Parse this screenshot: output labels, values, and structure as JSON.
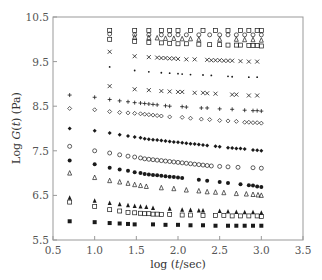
{
  "chart_data": {
    "type": "scatter",
    "title": "",
    "xlabel": "log (t/sec)",
    "ylabel": "Log G(t) (Pa)",
    "xlim": [
      0.5,
      3.5
    ],
    "ylim": [
      5.5,
      10.5
    ],
    "xticks": [
      "0.5",
      "1.0",
      "1.5",
      "2.0",
      "2.5",
      "3.0",
      "3.5"
    ],
    "yticks": [
      "5.5",
      "6.5",
      "7.5",
      "8.5",
      "9.5",
      "10.5"
    ],
    "grid": false,
    "legend": "none",
    "series": [
      {
        "name": "filled-square",
        "marker": "square-filled",
        "x": [
          0.7,
          1.0,
          1.18,
          1.3,
          1.4,
          1.48,
          1.7,
          1.85,
          2.0,
          2.15,
          2.3,
          2.45,
          2.6,
          2.7,
          2.8,
          2.9,
          3.0
        ],
        "y": [
          5.92,
          5.9,
          5.88,
          5.87,
          5.86,
          5.85,
          5.85,
          5.84,
          5.84,
          5.83,
          5.83,
          5.82,
          5.82,
          5.82,
          5.82,
          5.82,
          5.82
        ]
      },
      {
        "name": "open-square-low",
        "marker": "square-open",
        "x": [
          0.7,
          1.0,
          1.18,
          1.3,
          1.4,
          1.48,
          1.55,
          1.6,
          1.65,
          1.7,
          1.75,
          1.8,
          1.9,
          2.05,
          2.15,
          2.3,
          2.45,
          2.55,
          2.65,
          2.75,
          2.85,
          2.95,
          3.0
        ],
        "y": [
          6.35,
          6.25,
          6.18,
          6.15,
          6.12,
          6.11,
          6.1,
          6.09,
          6.09,
          6.08,
          6.08,
          6.07,
          6.07,
          6.06,
          6.06,
          6.05,
          6.05,
          6.05,
          6.04,
          6.04,
          6.04,
          6.04,
          6.03
        ]
      },
      {
        "name": "filled-triangle",
        "marker": "triangle-filled",
        "x": [
          0.7,
          1.0,
          1.18,
          1.3,
          1.4,
          1.48,
          1.55,
          1.62,
          1.7,
          1.9,
          2.05,
          2.15,
          2.25,
          2.3,
          2.5,
          2.6,
          2.7,
          2.8,
          2.9,
          3.0
        ],
        "y": [
          6.45,
          6.38,
          6.33,
          6.3,
          6.28,
          6.26,
          6.25,
          6.24,
          6.22,
          6.2,
          6.18,
          6.17,
          6.16,
          6.16,
          6.15,
          6.14,
          6.13,
          6.12,
          6.12,
          6.11
        ]
      },
      {
        "name": "open-triangle-low",
        "marker": "triangle-open",
        "x": [
          0.7,
          1.0,
          1.18,
          1.3,
          1.4,
          1.48,
          1.55,
          1.62,
          1.8,
          1.95,
          2.1,
          2.25,
          2.35,
          2.45,
          2.55,
          2.7,
          2.82,
          2.9,
          2.96,
          3.0
        ],
        "y": [
          7.0,
          6.9,
          6.83,
          6.8,
          6.77,
          6.74,
          6.72,
          6.7,
          6.67,
          6.65,
          6.62,
          6.6,
          6.58,
          6.57,
          6.56,
          6.54,
          6.53,
          6.52,
          6.51,
          6.5
        ]
      },
      {
        "name": "filled-circle-low",
        "marker": "circle-filled",
        "x": [
          0.7,
          1.0,
          1.18,
          1.3,
          1.4,
          1.48,
          1.55,
          1.6,
          1.65,
          1.7,
          1.75,
          1.8,
          1.85,
          1.9,
          1.95,
          2.0,
          2.05,
          2.25,
          2.35,
          2.5,
          2.6,
          2.75,
          2.85,
          2.9,
          2.95,
          3.0
        ],
        "y": [
          7.28,
          7.2,
          7.12,
          7.08,
          7.05,
          7.02,
          7.0,
          6.98,
          6.97,
          6.96,
          6.95,
          6.94,
          6.93,
          6.92,
          6.91,
          6.9,
          6.89,
          6.85,
          6.83,
          6.8,
          6.78,
          6.75,
          6.73,
          6.72,
          6.7,
          6.69
        ]
      },
      {
        "name": "open-circle-low",
        "marker": "circle-open",
        "x": [
          0.7,
          1.0,
          1.18,
          1.3,
          1.4,
          1.48,
          1.55,
          1.6,
          1.65,
          1.7,
          1.75,
          1.8,
          1.85,
          1.9,
          1.95,
          2.0,
          2.05,
          2.1,
          2.15,
          2.2,
          2.25,
          2.3,
          2.35,
          2.4,
          2.5,
          2.6,
          2.72,
          2.9,
          3.0
        ],
        "y": [
          7.6,
          7.5,
          7.45,
          7.41,
          7.38,
          7.36,
          7.34,
          7.32,
          7.31,
          7.3,
          7.29,
          7.28,
          7.27,
          7.26,
          7.25,
          7.24,
          7.23,
          7.22,
          7.21,
          7.2,
          7.19,
          7.18,
          7.17,
          7.16,
          7.15,
          7.14,
          7.13,
          7.12,
          7.11
        ]
      },
      {
        "name": "filled-diamond",
        "marker": "diamond-filled",
        "x": [
          0.7,
          1.0,
          1.18,
          1.3,
          1.4,
          1.48,
          1.55,
          1.6,
          1.65,
          1.7,
          1.75,
          1.8,
          1.85,
          1.9,
          1.95,
          2.0,
          2.05,
          2.1,
          2.15,
          2.2,
          2.25,
          2.3,
          2.35,
          2.45,
          2.5,
          2.6,
          2.65,
          2.7,
          2.75,
          2.8,
          2.9,
          2.95,
          3.0
        ],
        "y": [
          8.0,
          7.95,
          7.9,
          7.86,
          7.83,
          7.81,
          7.79,
          7.77,
          7.76,
          7.75,
          7.74,
          7.73,
          7.72,
          7.71,
          7.7,
          7.69,
          7.68,
          7.67,
          7.66,
          7.65,
          7.64,
          7.63,
          7.62,
          7.6,
          7.59,
          7.57,
          7.56,
          7.55,
          7.55,
          7.54,
          7.52,
          7.51,
          7.5
        ]
      },
      {
        "name": "open-diamond",
        "marker": "diamond-open",
        "x": [
          0.7,
          1.0,
          1.18,
          1.3,
          1.4,
          1.48,
          1.55,
          1.6,
          1.65,
          1.7,
          1.75,
          1.8,
          1.9,
          2.05,
          2.15,
          2.28,
          2.38,
          2.5,
          2.6,
          2.7,
          2.8,
          2.85,
          2.9,
          2.95,
          3.0
        ],
        "y": [
          8.45,
          8.42,
          8.38,
          8.36,
          8.35,
          8.34,
          8.33,
          8.32,
          8.31,
          8.3,
          8.29,
          8.28,
          8.26,
          8.25,
          8.23,
          8.21,
          8.2,
          8.18,
          8.17,
          8.16,
          8.14,
          8.14,
          8.13,
          8.13,
          8.12
        ]
      },
      {
        "name": "plus",
        "marker": "plus",
        "x": [
          0.7,
          1.0,
          1.18,
          1.3,
          1.4,
          1.48,
          1.55,
          1.6,
          1.65,
          1.7,
          1.75,
          1.85,
          1.9,
          2.05,
          2.1,
          2.28,
          2.35,
          2.5,
          2.65,
          2.8,
          2.9,
          2.95,
          3.0
        ],
        "y": [
          8.75,
          8.7,
          8.65,
          8.62,
          8.6,
          8.58,
          8.57,
          8.56,
          8.55,
          8.54,
          8.53,
          8.51,
          8.5,
          8.49,
          8.48,
          8.46,
          8.46,
          8.44,
          8.43,
          8.41,
          8.4,
          8.4,
          8.39
        ]
      },
      {
        "name": "cross-low",
        "marker": "x",
        "x": [
          1.18,
          1.48,
          1.65,
          1.8,
          1.9,
          2.0,
          2.05,
          2.2,
          2.3,
          2.35,
          2.45,
          2.65,
          2.7,
          2.85,
          2.95
        ],
        "y": [
          8.95,
          8.88,
          8.86,
          8.84,
          8.83,
          8.82,
          8.82,
          8.8,
          8.8,
          8.79,
          8.78,
          8.76,
          8.76,
          8.74,
          8.74
        ]
      },
      {
        "name": "dot-mid",
        "marker": "dot",
        "x": [
          1.18,
          1.48,
          1.65,
          1.8,
          1.9,
          2.0,
          2.05,
          2.15,
          2.3,
          2.4,
          2.6,
          2.65,
          2.85,
          2.95
        ],
        "y": [
          9.38,
          9.3,
          9.27,
          9.25,
          9.24,
          9.23,
          9.22,
          9.21,
          9.2,
          9.19,
          9.17,
          9.16,
          9.15,
          9.15
        ]
      },
      {
        "name": "cross-high",
        "marker": "x",
        "x": [
          1.18,
          1.48,
          1.65,
          1.75,
          1.8,
          1.85,
          1.9,
          1.95,
          2.0,
          2.1,
          2.2,
          2.35,
          2.4,
          2.45,
          2.5,
          2.55,
          2.6,
          2.65,
          2.75,
          2.85,
          2.95
        ],
        "y": [
          9.72,
          9.62,
          9.6,
          9.59,
          9.58,
          9.58,
          9.57,
          9.57,
          9.56,
          9.55,
          9.55,
          9.54,
          9.53,
          9.53,
          9.53,
          9.52,
          9.52,
          9.52,
          9.51,
          9.5,
          9.5
        ]
      },
      {
        "name": "open-square-high",
        "marker": "square-open",
        "x": [
          1.18,
          1.48,
          1.65,
          1.8,
          1.9,
          2.0,
          2.1,
          2.25,
          2.38,
          2.5,
          2.6,
          2.7,
          2.75,
          2.85,
          2.9,
          2.95,
          3.0
        ],
        "y": [
          10.0,
          9.95,
          9.93,
          9.92,
          9.91,
          9.9,
          9.9,
          9.89,
          9.88,
          9.88,
          9.87,
          9.87,
          9.87,
          9.86,
          9.86,
          9.86,
          9.85
        ]
      },
      {
        "name": "open-triangle-high",
        "marker": "triangle-open",
        "x": [
          1.48,
          1.65,
          1.75,
          1.85,
          1.95,
          2.05,
          2.15,
          2.25,
          2.5,
          2.7,
          2.8,
          2.9,
          3.0
        ],
        "y": [
          10.05,
          10.04,
          10.03,
          10.02,
          10.02,
          10.01,
          10.01,
          10.0,
          10.0,
          10.0,
          9.99,
          9.99,
          9.98
        ]
      },
      {
        "name": "open-circle-high",
        "marker": "circle-open",
        "x": [
          1.18,
          1.48,
          1.65,
          1.8,
          1.9,
          2.0,
          2.1,
          2.25,
          2.38,
          2.5,
          2.6,
          2.7,
          2.8,
          2.9,
          3.0
        ],
        "y": [
          10.12,
          10.1,
          10.1,
          10.1,
          10.1,
          10.1,
          10.1,
          10.1,
          10.1,
          10.1,
          10.1,
          10.1,
          10.1,
          10.1,
          10.1
        ]
      },
      {
        "name": "open-square-top",
        "marker": "square-open",
        "x": [
          1.18,
          1.48,
          1.65,
          1.8,
          1.9,
          2.0,
          2.15,
          2.3,
          2.45,
          2.6,
          2.75,
          2.85,
          2.95,
          3.0
        ],
        "y": [
          10.2,
          10.2,
          10.2,
          10.2,
          10.2,
          10.2,
          10.2,
          10.2,
          10.2,
          10.2,
          10.2,
          10.2,
          10.2,
          10.2
        ]
      }
    ]
  },
  "axes": {
    "xlabel_prefix": "log (",
    "xlabel_var": "t",
    "xlabel_suffix": "/sec)",
    "ylabel_prefix": "Log ",
    "ylabel_var": "G",
    "ylabel_mid": "(",
    "ylabel_var2": "t",
    "ylabel_suffix": ") (Pa)"
  },
  "colors": {
    "marker": "#1a1a1a",
    "axis": "#888888",
    "text": "#444444"
  }
}
